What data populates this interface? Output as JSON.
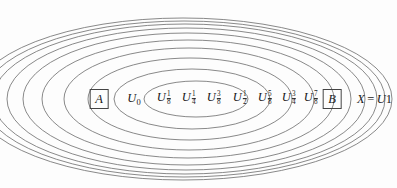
{
  "figure": {
    "name": "nested-open-sets-urysohn-diagram",
    "background_color": "#fdfdfd",
    "stroke_color": "#6b6b6b",
    "text_color": "#1a1a1a",
    "box_border_color": "#444444"
  },
  "ellipses": [
    {
      "index": 0,
      "name": "U_0",
      "cx": 196,
      "cy": 99,
      "rx": 52,
      "ry": 18
    },
    {
      "index": 1,
      "name": "U_1/8",
      "cx": 192,
      "cy": 99,
      "rx": 78,
      "ry": 30
    },
    {
      "index": 2,
      "name": "U_1/4",
      "cx": 190,
      "cy": 99,
      "rx": 102,
      "ry": 41
    },
    {
      "index": 3,
      "name": "U_3/8",
      "cx": 189,
      "cy": 99,
      "rx": 125,
      "ry": 51
    },
    {
      "index": 4,
      "name": "U_1/2",
      "cx": 188,
      "cy": 99,
      "rx": 146,
      "ry": 59
    },
    {
      "index": 5,
      "name": "U_5/8",
      "cx": 187,
      "cy": 99,
      "rx": 164,
      "ry": 66
    },
    {
      "index": 6,
      "name": "U_3/4",
      "cx": 186,
      "cy": 99,
      "rx": 179,
      "ry": 71
    },
    {
      "index": 7,
      "name": "U_7/8",
      "cx": 185,
      "cy": 99,
      "rx": 192,
      "ry": 75
    },
    {
      "index": 8,
      "name": "B-ring",
      "cx": 184,
      "cy": 99,
      "rx": 201,
      "ry": 78
    },
    {
      "index": 9,
      "name": "X_U_1",
      "cx": 183,
      "cy": 99,
      "rx": 209,
      "ry": 81
    }
  ],
  "labels": {
    "boxed": [
      {
        "id": "set-a",
        "text": "A",
        "x": 99,
        "y": 99
      },
      {
        "id": "set-b",
        "text": "B",
        "x": 332,
        "y": 99
      }
    ],
    "sets": [
      {
        "id": "u-0",
        "base": "U",
        "sub_type": "int",
        "sub": "0",
        "x": 134,
        "y": 99
      },
      {
        "id": "u-1-8",
        "base": "U",
        "sub_type": "frac",
        "num": "1",
        "den": "8",
        "x": 164,
        "y": 99
      },
      {
        "id": "u-1-4",
        "base": "U",
        "sub_type": "frac",
        "num": "1",
        "den": "4",
        "x": 189,
        "y": 99
      },
      {
        "id": "u-3-8",
        "base": "U",
        "sub_type": "frac",
        "num": "3",
        "den": "8",
        "x": 214,
        "y": 99
      },
      {
        "id": "u-1-2",
        "base": "U",
        "sub_type": "frac",
        "num": "1",
        "den": "2",
        "x": 240,
        "y": 99
      },
      {
        "id": "u-5-8",
        "base": "U",
        "sub_type": "frac",
        "num": "5",
        "den": "8",
        "x": 265,
        "y": 99
      },
      {
        "id": "u-3-4",
        "base": "U",
        "sub_type": "frac",
        "num": "3",
        "den": "4",
        "x": 289,
        "y": 99
      },
      {
        "id": "u-7-8",
        "base": "U",
        "sub_type": "frac",
        "num": "7",
        "den": "8",
        "x": 311,
        "y": 99
      }
    ],
    "equation": {
      "id": "x-equals-u1",
      "lhs": "X",
      "operator": "=",
      "rhs_base": "U",
      "rhs_sub": "1",
      "x": 357,
      "y": 99
    }
  }
}
